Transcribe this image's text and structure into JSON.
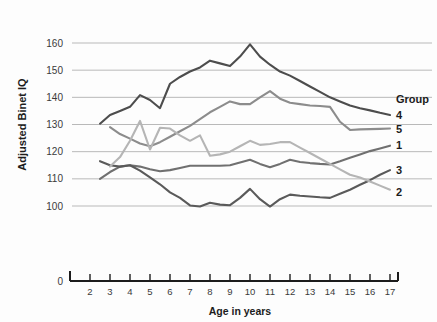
{
  "chart_data": {
    "type": "line",
    "title": "",
    "xlabel": "Age in years",
    "ylabel": "Adjusted Binet IQ",
    "xlim": [
      2,
      17
    ],
    "ylim": [
      100,
      160
    ],
    "y_axis_break_to_zero": true,
    "grid": true,
    "legend_position": "right",
    "legend_title": "Group",
    "yticks": [
      "0",
      "100",
      "110",
      "120",
      "130",
      "140",
      "150",
      "160"
    ],
    "xticks": [
      "2",
      "3",
      "4",
      "5",
      "6",
      "7",
      "8",
      "9",
      "10",
      "11",
      "12",
      "13",
      "14",
      "15",
      "16",
      "17"
    ],
    "x": [
      2.5,
      3,
      3.5,
      4,
      4.5,
      5,
      5.5,
      6,
      6.5,
      7,
      7.5,
      8,
      8.5,
      9,
      9.5,
      10,
      10.5,
      11,
      11.5,
      12,
      12.5,
      13,
      13.5,
      14,
      14.5,
      15,
      15.5,
      16,
      16.5,
      17
    ],
    "series": [
      {
        "name": "4",
        "label": "4",
        "color": "#4d4d4d",
        "values": [
          130.3,
          133.5,
          135.0,
          136.5,
          140.8,
          139.0,
          136.0,
          145.0,
          147.5,
          149.5,
          151.0,
          153.5,
          152.5,
          151.5,
          155.0,
          159.5,
          155.0,
          152.0,
          149.5,
          148.0,
          146.0,
          144.0,
          142.0,
          140.0,
          138.5,
          137.0,
          136.0,
          135.2,
          134.3,
          133.5
        ]
      },
      {
        "name": "5",
        "label": "5",
        "color": "#8c8c8c",
        "values": [
          128.5,
          129.0,
          126.5,
          124.8,
          123.0,
          122.0,
          123.5,
          125.5,
          127.5,
          129.5,
          132.0,
          134.5,
          136.5,
          138.5,
          137.5,
          137.5,
          140.0,
          142.3,
          139.5,
          138.0,
          137.5,
          137.0,
          136.8,
          136.5,
          131.0,
          128.0,
          128.2,
          128.3,
          128.4,
          128.5
        ]
      },
      {
        "name": "1",
        "label": "1",
        "color": "#707070",
        "values": [
          110.0,
          112.5,
          114.5,
          115.0,
          114.5,
          113.5,
          112.8,
          113.2,
          114.0,
          114.8,
          114.8,
          114.8,
          114.8,
          115.0,
          116.0,
          117.0,
          115.5,
          114.3,
          115.5,
          117.0,
          116.2,
          115.8,
          115.5,
          115.3,
          116.5,
          117.8,
          119.0,
          120.2,
          121.2,
          122.2
        ]
      },
      {
        "name": "3",
        "label": "3",
        "color": "#5a5a5a",
        "values": [
          116.5,
          115.0,
          114.5,
          115.0,
          113.0,
          110.5,
          108.0,
          105.0,
          103.0,
          100.2,
          99.8,
          101.2,
          100.5,
          100.3,
          103.0,
          106.3,
          102.5,
          99.8,
          102.5,
          104.2,
          103.8,
          103.5,
          103.2,
          103.0,
          104.5,
          106.0,
          107.8,
          109.5,
          111.5,
          113.2
        ]
      },
      {
        "name": "2",
        "label": "2",
        "color": "#b5b5b5",
        "values": [
          111.5,
          114.5,
          118.0,
          124.0,
          131.3,
          120.8,
          128.8,
          128.5,
          126.0,
          124.0,
          126.0,
          118.5,
          119.0,
          120.0,
          122.0,
          124.0,
          122.5,
          122.8,
          123.5,
          123.5,
          121.5,
          119.5,
          117.5,
          115.5,
          113.5,
          111.5,
          110.5,
          109.0,
          107.5,
          106.0
        ]
      }
    ],
    "series_drop_first": {
      "2": 1,
      "5": 1
    }
  }
}
